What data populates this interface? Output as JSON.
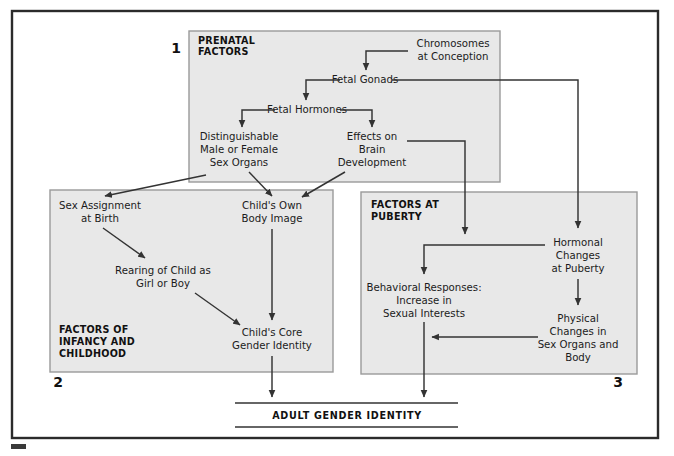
{
  "figure": {
    "outcome_label": "ADULT GENDER IDENTITY",
    "colors": {
      "panel_fill": "#e8e8e8",
      "panel_border": "#9a9a9a",
      "frame": "#2b2b2b",
      "line": "#333333",
      "text": "#1b1b1b"
    }
  },
  "panels": [
    {
      "number": "1",
      "title_line1": "PRENATAL",
      "title_line2": "FACTORS"
    },
    {
      "number": "2",
      "title_line1": "FACTORS OF",
      "title_line2": "INFANCY AND",
      "title_line3": "CHILDHOOD"
    },
    {
      "number": "3",
      "title_line1": "FACTORS AT",
      "title_line2": "PUBERTY"
    }
  ],
  "nodes": {
    "chromosomes": {
      "line1": "Chromosomes",
      "line2": "at Conception"
    },
    "fetal_gonads": {
      "line1": "Fetal Gonads"
    },
    "fetal_hormones": {
      "line1": "Fetal Hormones"
    },
    "sex_organs": {
      "line1": "Distinguishable",
      "line2": "Male or Female",
      "line3": "Sex Organs"
    },
    "brain_dev": {
      "line1": "Effects on",
      "line2": "Brain",
      "line3": "Development"
    },
    "sex_assignment": {
      "line1": "Sex Assignment",
      "line2": "at Birth"
    },
    "rearing": {
      "line1": "Rearing of Child as",
      "line2": "Girl or Boy"
    },
    "body_image": {
      "line1": "Child's Own",
      "line2": "Body Image"
    },
    "core_gender": {
      "line1": "Child's Core",
      "line2": "Gender Identity"
    },
    "hormonal_changes": {
      "line1": "Hormonal",
      "line2": "Changes",
      "line3": "at Puberty"
    },
    "behavioral": {
      "line1": "Behavioral Responses:",
      "line2": "Increase in",
      "line3": "Sexual Interests"
    },
    "physical_changes": {
      "line1": "Physical",
      "line2": "Changes in",
      "line3": "Sex Organs and",
      "line4": "Body"
    }
  }
}
